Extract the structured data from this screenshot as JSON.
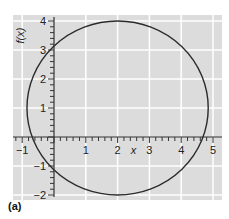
{
  "chart_data": {
    "type": "line",
    "title": "",
    "xlabel": "x",
    "ylabel": "f(x)",
    "xlim": [
      -1.3,
      5.3
    ],
    "ylim": [
      -2.2,
      4.2
    ],
    "x_ticks": [
      -1,
      1,
      2,
      3,
      4,
      5
    ],
    "y_ticks": [
      -2,
      -1,
      1,
      2,
      3,
      4
    ],
    "minor_tick_step": 0.2,
    "grid": true,
    "series": [
      {
        "name": "ellipse",
        "shape": "ellipse",
        "center": [
          2,
          1
        ],
        "radius_x": 2.85,
        "radius_y": 3,
        "color": "#2b2b2b"
      }
    ],
    "background_color": "#dcdcdc",
    "grid_color": "#ffffff"
  },
  "panel_label": "(a)"
}
